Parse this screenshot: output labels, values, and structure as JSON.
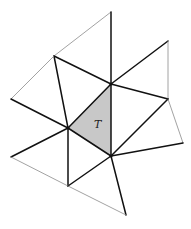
{
  "diagram": {
    "label": "T",
    "shade_color": "#c8c8c8",
    "vertices": {
      "A": "top",
      "B": "upper-left",
      "C": "center-top",
      "D": "upper-right",
      "E": "right",
      "F": "left",
      "G": "center-left",
      "H": "center-bottom",
      "I": "far-right",
      "J": "lower-left",
      "K": "bottom-left",
      "L": "bottom"
    },
    "shaded_triangle": [
      "C",
      "G",
      "H"
    ],
    "edges": [
      {
        "from": "A",
        "to": "B",
        "style": "thin"
      },
      {
        "from": "A",
        "to": "C",
        "style": "thick"
      },
      {
        "from": "B",
        "to": "C",
        "style": "thick"
      },
      {
        "from": "B",
        "to": "G",
        "style": "thick"
      },
      {
        "from": "B",
        "to": "F",
        "style": "thin"
      },
      {
        "from": "F",
        "to": "G",
        "style": "thick"
      },
      {
        "from": "C",
        "to": "D",
        "style": "thick"
      },
      {
        "from": "D",
        "to": "E",
        "style": "thin"
      },
      {
        "from": "C",
        "to": "E",
        "style": "thick"
      },
      {
        "from": "C",
        "to": "G",
        "style": "thick"
      },
      {
        "from": "C",
        "to": "H",
        "style": "thick"
      },
      {
        "from": "E",
        "to": "H",
        "style": "thick"
      },
      {
        "from": "E",
        "to": "I",
        "style": "thin"
      },
      {
        "from": "H",
        "to": "I",
        "style": "thick"
      },
      {
        "from": "G",
        "to": "H",
        "style": "thick"
      },
      {
        "from": "G",
        "to": "J",
        "style": "thick"
      },
      {
        "from": "G",
        "to": "K",
        "style": "thick"
      },
      {
        "from": "J",
        "to": "K",
        "style": "thin"
      },
      {
        "from": "K",
        "to": "H",
        "style": "thick"
      },
      {
        "from": "H",
        "to": "L",
        "style": "thick"
      },
      {
        "from": "K",
        "to": "L",
        "style": "thin"
      }
    ]
  }
}
